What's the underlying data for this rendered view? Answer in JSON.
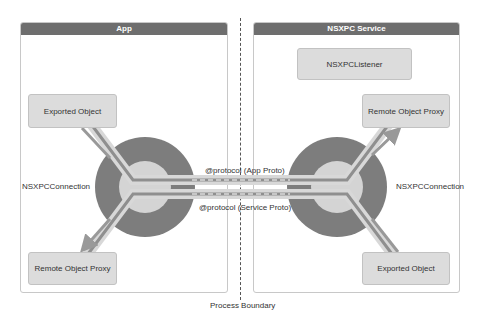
{
  "panels": {
    "app": {
      "title": "App"
    },
    "service": {
      "title": "NSXPC Service"
    }
  },
  "nodes": {
    "app_exported_object": "Exported Object",
    "app_remote_proxy": "Remote Object Proxy",
    "service_listener": "NSXPCListener",
    "service_remote_proxy": "Remote Object Proxy",
    "service_exported_object": "Exported Object"
  },
  "labels": {
    "app_connection": "NSXPCConnection",
    "service_connection": "NSXPCConnection",
    "app_protocol": "@protocol (App Proto)",
    "service_protocol": "@protocol (Service Proto)",
    "process_boundary": "Process Boundary"
  },
  "colors": {
    "header": "#6e6e6e",
    "outer_ring": "#7d7d7d",
    "inner_circle": "#d4d4d4",
    "node_fill": "#dcdcdc",
    "pipe_dark": "#8f8f8f",
    "pipe_light": "#d8d8d8"
  }
}
